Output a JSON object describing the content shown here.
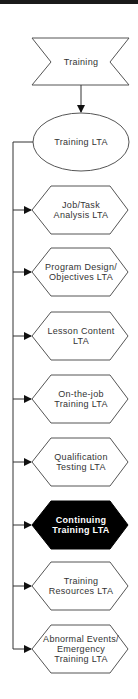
{
  "diagram": {
    "root": {
      "label": "Training",
      "shape": "banner"
    },
    "hub": {
      "label": "Training LTA",
      "shape": "ellipse"
    },
    "children": [
      {
        "label": "Job/Task\nAnalysis LTA",
        "highlighted": false
      },
      {
        "label": "Program Design/\nObjectives LTA",
        "highlighted": false
      },
      {
        "label": "Lesson Content\nLTA",
        "highlighted": false
      },
      {
        "label": "On-the-job\nTraining LTA",
        "highlighted": false
      },
      {
        "label": "Qualification\nTesting LTA",
        "highlighted": false
      },
      {
        "label": "Continuing\nTraining LTA",
        "highlighted": true
      },
      {
        "label": "Training\nResources LTA",
        "highlighted": false
      },
      {
        "label": "Abnormal Events/\nEmergency\nTraining LTA",
        "highlighted": false
      }
    ],
    "colors": {
      "stroke": "#555555",
      "highlight_fill": "#000000",
      "fill": "#ffffff"
    }
  }
}
